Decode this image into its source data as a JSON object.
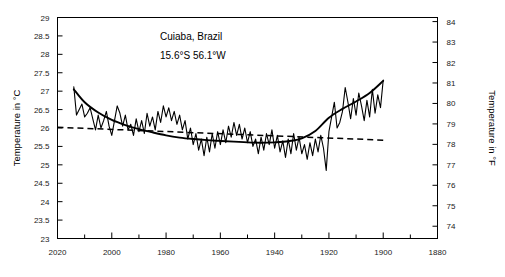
{
  "chart_data": {
    "type": "line",
    "title": "Cuiaba, Brazil",
    "subtitle": "15.6°S  56.1°W",
    "xlabel": "",
    "ylabel": "Temperature in °C",
    "ylabel_right": "Temperature in °F",
    "grid": false,
    "legend": "none",
    "x_axis_reversed": true,
    "xlim": [
      1880,
      2020
    ],
    "ylim": [
      23,
      29
    ],
    "ylim_right": [
      73.4,
      84.2
    ],
    "x_tick_labels": [
      "2020",
      "2000",
      "1980",
      "1960",
      "1940",
      "1920",
      "1900",
      "1880"
    ],
    "x_ticks": [
      2020,
      2000,
      1980,
      1960,
      1940,
      1920,
      1900,
      1880
    ],
    "x_minor_ticks": [
      2010,
      1990,
      1970,
      1950,
      1930,
      1910,
      1890
    ],
    "y_tick_labels": [
      "29",
      "28.5",
      "28",
      "27.5",
      "27",
      "26.5",
      "26",
      "25.5",
      "25",
      "24.5",
      "24",
      "23.5",
      "23"
    ],
    "y_ticks": [
      29,
      28.5,
      28,
      27.5,
      27,
      26.5,
      26,
      25.5,
      25,
      24.5,
      24,
      23.5,
      23
    ],
    "y_ticks_right": [
      84,
      83,
      82,
      81,
      80,
      79,
      78,
      77,
      76,
      75,
      74
    ],
    "y_tick_labels_right": [
      "84",
      "83",
      "82",
      "81",
      "80",
      "79",
      "78",
      "77",
      "76",
      "75",
      "74"
    ],
    "series": [
      {
        "name": "annual mean temperature",
        "style": "solid-thin",
        "x": [
          1900,
          1901,
          1902,
          1903,
          1904,
          1905,
          1906,
          1907,
          1908,
          1909,
          1910,
          1911,
          1912,
          1913,
          1914,
          1915,
          1916,
          1917,
          1918,
          1919,
          1920,
          1921,
          1922,
          1923,
          1924,
          1925,
          1926,
          1927,
          1928,
          1929,
          1930,
          1931,
          1932,
          1933,
          1934,
          1935,
          1936,
          1937,
          1938,
          1939,
          1940,
          1941,
          1942,
          1943,
          1944,
          1945,
          1946,
          1947,
          1948,
          1949,
          1950,
          1951,
          1952,
          1953,
          1954,
          1955,
          1956,
          1957,
          1958,
          1959,
          1960,
          1961,
          1962,
          1963,
          1964,
          1965,
          1966,
          1967,
          1968,
          1969,
          1970,
          1971,
          1972,
          1973,
          1974,
          1975,
          1976,
          1977,
          1978,
          1979,
          1980,
          1981,
          1982,
          1983,
          1984,
          1985,
          1986,
          1987,
          1988,
          1989,
          1990,
          1991,
          1992,
          1993,
          1994,
          1995,
          1996,
          1997,
          1998,
          1999,
          2000,
          2001,
          2002,
          2003,
          2004,
          2005,
          2006,
          2007,
          2008,
          2009,
          2010,
          2011,
          2012,
          2013,
          2014
        ],
        "values": [
          27.3,
          26.55,
          26.9,
          26.4,
          27.05,
          26.3,
          26.75,
          26.2,
          26.6,
          26.95,
          26.35,
          26.8,
          26.25,
          26.7,
          27.1,
          26.45,
          26.15,
          26.0,
          26.7,
          26.3,
          25.9,
          24.85,
          25.45,
          25.8,
          25.35,
          25.7,
          25.25,
          25.6,
          25.15,
          25.55,
          25.3,
          25.75,
          25.4,
          25.85,
          25.3,
          25.7,
          25.2,
          25.65,
          25.35,
          25.8,
          25.45,
          25.95,
          25.55,
          25.85,
          25.4,
          25.75,
          25.3,
          25.7,
          25.5,
          25.9,
          25.6,
          26.0,
          25.7,
          26.1,
          25.8,
          26.15,
          25.75,
          26.05,
          25.6,
          25.95,
          25.55,
          25.9,
          25.45,
          25.85,
          25.35,
          25.75,
          25.25,
          25.7,
          25.4,
          25.85,
          25.55,
          26.0,
          25.7,
          26.2,
          25.95,
          26.35,
          26.1,
          26.45,
          26.2,
          26.55,
          26.3,
          26.6,
          26.15,
          26.45,
          25.95,
          26.3,
          26.05,
          26.4,
          25.85,
          26.2,
          25.9,
          26.25,
          25.8,
          26.1,
          25.95,
          26.35,
          26.05,
          26.4,
          26.6,
          26.2,
          25.8,
          26.05,
          26.45,
          26.2,
          26.0,
          26.35,
          25.95,
          26.25,
          26.55,
          26.4,
          26.3,
          26.65,
          26.5,
          26.35,
          27.12
        ]
      },
      {
        "name": "smoothed trend (LOESS)",
        "style": "solid-thick",
        "x": [
          1900,
          1905,
          1910,
          1915,
          1920,
          1925,
          1930,
          1935,
          1940,
          1945,
          1950,
          1955,
          1960,
          1965,
          1970,
          1975,
          1980,
          1985,
          1990,
          1995,
          2000,
          2005,
          2010,
          2014
        ],
        "values": [
          27.28,
          26.95,
          26.72,
          26.52,
          26.28,
          25.92,
          25.72,
          25.64,
          25.61,
          25.6,
          25.61,
          25.63,
          25.65,
          25.67,
          25.7,
          25.74,
          25.8,
          25.88,
          25.97,
          26.08,
          26.22,
          26.42,
          26.7,
          27.05
        ]
      },
      {
        "name": "linear trend",
        "style": "dashed",
        "x": [
          1900,
          2020
        ],
        "values": [
          25.67,
          26.02
        ]
      }
    ]
  },
  "annotations": {
    "station_name": "Cuiaba, Brazil",
    "coordinates": "15.6°S  56.1°W"
  }
}
